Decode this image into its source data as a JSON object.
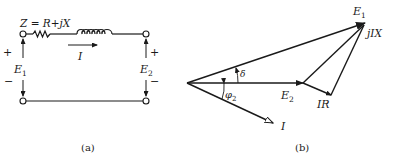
{
  "figure_a": {
    "caption": "(a)",
    "impedance_label": "Z = R+jX",
    "current_label": "I",
    "left_voltage": {
      "name": "E",
      "subscript": "1",
      "plus": "+",
      "minus": "−"
    },
    "right_voltage": {
      "name": "E",
      "subscript": "2",
      "plus": "+",
      "minus": "−"
    }
  },
  "figure_b": {
    "caption": "(b)",
    "phasors": {
      "E1": {
        "name": "E",
        "subscript": "1"
      },
      "E2": {
        "name": "E",
        "subscript": "2"
      },
      "I": {
        "name": "I"
      },
      "IR": {
        "name": "IR"
      },
      "jIX": {
        "name": "jIX"
      }
    },
    "angles": {
      "delta": "δ",
      "phi2": {
        "name": "φ",
        "subscript": "2"
      }
    }
  },
  "colors": {
    "ink": "#1a1a1a",
    "background": "#ffffff"
  }
}
